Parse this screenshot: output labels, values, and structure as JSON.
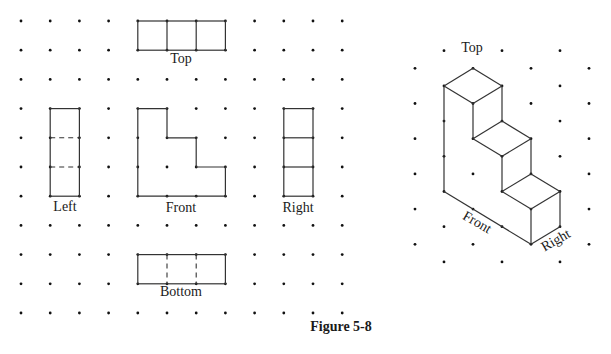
{
  "figure": {
    "caption": "Figure 5-8",
    "colors": {
      "line": "#333333",
      "dot": "#111111",
      "text": "#1a1a1a",
      "background": "#ffffff"
    }
  },
  "orthographic": {
    "grid": {
      "cols": 12,
      "rows": 11,
      "x0": 21,
      "y0": 21,
      "dx": 29.2,
      "dy": 29.2
    },
    "views": [
      {
        "name": "top",
        "label": "Top",
        "rect": [
          4,
          0,
          7,
          1
        ],
        "solid_v": [
          5,
          6
        ],
        "dashed_v": [],
        "solid_h": [],
        "dashed_h": [],
        "label_pos": [
          181,
          63
        ]
      },
      {
        "name": "left",
        "label": "Left",
        "rect": [
          1,
          3,
          2,
          6
        ],
        "solid_v": [],
        "dashed_v": [],
        "solid_h": [],
        "dashed_h": [
          4,
          5
        ],
        "label_pos": [
          65,
          211
        ]
      },
      {
        "name": "right",
        "label": "Right",
        "rect": [
          9,
          3,
          10,
          6
        ],
        "solid_v": [],
        "dashed_v": [],
        "solid_h": [
          4,
          5
        ],
        "dashed_h": [],
        "label_pos": [
          298,
          212
        ]
      },
      {
        "name": "bottom",
        "label": "Bottom",
        "rect": [
          4,
          8,
          7,
          9
        ],
        "solid_v": [],
        "dashed_v": [
          5,
          6
        ],
        "solid_h": [],
        "dashed_h": [],
        "label_pos": [
          181,
          296
        ]
      }
    ],
    "front": {
      "label": "Front",
      "polygon": [
        [
          4,
          3
        ],
        [
          5,
          3
        ],
        [
          5,
          4
        ],
        [
          6,
          4
        ],
        [
          6,
          5
        ],
        [
          7,
          5
        ],
        [
          7,
          6
        ],
        [
          4,
          6
        ]
      ],
      "label_pos": [
        181,
        212
      ]
    }
  },
  "isometric": {
    "grid": {
      "cols": 7,
      "rows": 13,
      "x0": 415,
      "y0": 50.7,
      "dx": 29.0,
      "dy": 17.6
    },
    "top_label": {
      "text": "Top",
      "pos": [
        472,
        52
      ]
    },
    "front_label": {
      "text": "Front",
      "pos": [
        475,
        226
      ],
      "rotate": 30
    },
    "right_label": {
      "text": "Right",
      "pos": [
        558,
        244
      ],
      "rotate": -30
    },
    "edges": [
      [
        [
          2,
          1
        ],
        [
          1,
          2
        ]
      ],
      [
        [
          2,
          1
        ],
        [
          3,
          2
        ]
      ],
      [
        [
          1,
          2
        ],
        [
          2,
          3
        ]
      ],
      [
        [
          3,
          2
        ],
        [
          2,
          3
        ]
      ],
      [
        [
          1,
          2
        ],
        [
          1,
          8
        ]
      ],
      [
        [
          2,
          3
        ],
        [
          2,
          5
        ]
      ],
      [
        [
          3,
          2
        ],
        [
          3,
          4
        ]
      ],
      [
        [
          3,
          4
        ],
        [
          2,
          5
        ]
      ],
      [
        [
          3,
          4
        ],
        [
          4,
          5
        ]
      ],
      [
        [
          2,
          5
        ],
        [
          3,
          6
        ]
      ],
      [
        [
          4,
          5
        ],
        [
          3,
          6
        ]
      ],
      [
        [
          3,
          6
        ],
        [
          3,
          8
        ]
      ],
      [
        [
          4,
          5
        ],
        [
          4,
          7
        ]
      ],
      [
        [
          4,
          7
        ],
        [
          3,
          8
        ]
      ],
      [
        [
          4,
          7
        ],
        [
          5,
          8
        ]
      ],
      [
        [
          3,
          8
        ],
        [
          4,
          9
        ]
      ],
      [
        [
          5,
          8
        ],
        [
          4,
          9
        ]
      ],
      [
        [
          4,
          9
        ],
        [
          4,
          11
        ]
      ],
      [
        [
          5,
          8
        ],
        [
          5,
          10
        ]
      ],
      [
        [
          1,
          8
        ],
        [
          4,
          11
        ]
      ],
      [
        [
          4,
          11
        ],
        [
          5,
          10
        ]
      ]
    ],
    "hidden_dots": [
      [
        2,
        0
      ]
    ]
  }
}
